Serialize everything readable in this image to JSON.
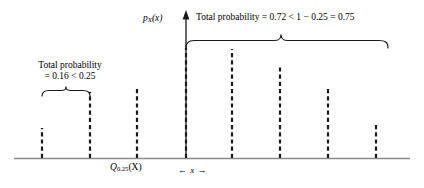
{
  "figure": {
    "background_color": "#ffffff",
    "ink_color": "#1a1a1a",
    "axis_color": "#808080"
  },
  "annotations": {
    "left_bracket_label_line1": "Total probability",
    "left_bracket_label_line2": "= 0.16 < 0.25",
    "top_bracket_label": "Total probability = 0.72 < 1 − 0.25 = 0.75",
    "pmf_axis_label_base": "p",
    "pmf_axis_label_sub": "X",
    "pmf_axis_label_arg": "(x)",
    "quantile_label_base": "Q",
    "quantile_label_sub": "0.25",
    "quantile_label_arg": "(X)",
    "x_axis_label": "← x →"
  },
  "chart_data": {
    "type": "bar",
    "title": "",
    "subtitle": "",
    "xlabel": "x",
    "ylabel": "p_X(x)",
    "grid": false,
    "legend": null,
    "axis_ranges": {
      "x": [
        0,
        424
      ],
      "y": [
        0,
        188
      ]
    },
    "bar_style": "dashed-vertical-stem",
    "baseline_y_px": 158,
    "categories": [
      "b1",
      "b2",
      "b3",
      "b4",
      "b5",
      "b6",
      "b7",
      "b8"
    ],
    "bars": [
      {
        "id": "b1",
        "x_px": 42,
        "top_px": 128,
        "height_px": 30,
        "probability": 0.06
      },
      {
        "id": "b2",
        "x_px": 90,
        "top_px": 92,
        "height_px": 66,
        "probability": 0.1
      },
      {
        "id": "b3",
        "x_px": 137,
        "top_px": 88,
        "height_px": 70,
        "probability": 0.12
      },
      {
        "id": "b4",
        "x_px": 186,
        "top_px": 48,
        "height_px": 110,
        "probability": 0.22
      },
      {
        "id": "b5",
        "x_px": 232,
        "top_px": 49,
        "height_px": 109,
        "probability": 0.21
      },
      {
        "id": "b6",
        "x_px": 280,
        "top_px": 66,
        "height_px": 92,
        "probability": 0.17
      },
      {
        "id": "b7",
        "x_px": 328,
        "top_px": 88,
        "height_px": 70,
        "probability": 0.09
      },
      {
        "id": "b8",
        "x_px": 376,
        "top_px": 125,
        "height_px": 33,
        "probability": 0.03
      }
    ],
    "values": [
      0.06,
      0.1,
      0.12,
      0.22,
      0.21,
      0.17,
      0.09,
      0.03
    ],
    "annotations": [
      {
        "name": "left-bracket",
        "text": "Total probability = 0.16 < 0.25",
        "spans_bars": [
          "b1",
          "b2"
        ],
        "total_probability": 0.16,
        "comparison": "< 0.25"
      },
      {
        "name": "top-bracket",
        "text": "Total probability = 0.72 < 1 − 0.25 = 0.75",
        "spans_bars": [
          "b4",
          "b5",
          "b6",
          "b7",
          "b8"
        ],
        "total_probability": 0.72,
        "comparison": "< 1 − 0.25 = 0.75"
      },
      {
        "name": "quantile-marker",
        "text": "Q_0.25(X)",
        "at_bar": "b3"
      }
    ]
  }
}
